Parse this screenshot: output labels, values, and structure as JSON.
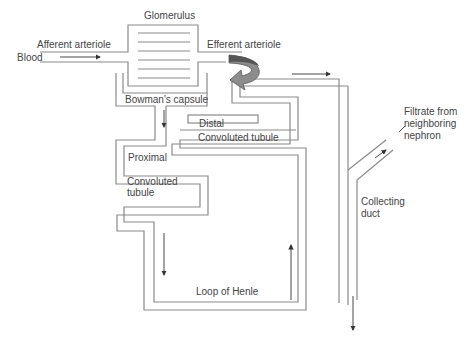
{
  "diagram": {
    "stroke_color": "#8a8a8a",
    "arrow_color": "#333333",
    "curved_arrow_fill": "#8c8c8c",
    "curved_arrow_dark": "#555555",
    "labels": {
      "glomerulus": "Glomerulus",
      "afferent_arteriole": "Afferent arteriole",
      "blood": "Blood",
      "efferent_arteriole": "Efferent arteriole",
      "bowmans_capsule": "Bowman's capsule",
      "distal": "Distal",
      "distal_convoluted": "Convoluted tubule",
      "proximal": "Proximal",
      "proximal_convoluted_1": "Convoluted",
      "proximal_convoluted_2": "tubule",
      "filtrate_1": "Filtrate from",
      "filtrate_2": "neighboring",
      "filtrate_3": "nephron",
      "collecting_1": "Collecting",
      "collecting_2": "duct",
      "loop_of_henle": "Loop of Henle"
    }
  }
}
